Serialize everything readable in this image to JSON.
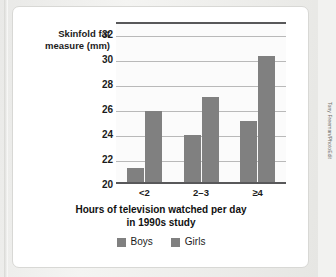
{
  "figure": {
    "credit": "Tony Freeman/PhotoEdit"
  },
  "chart_data": {
    "type": "bar",
    "title": "",
    "xlabel": "Hours of television watched per day in 1990s study",
    "xlabel_line1": "Hours of television watched per day",
    "xlabel_line2": "in 1990s study",
    "ylabel": "Skinfold fat measure (mm)",
    "ylabel_line1": "Skinfold fat",
    "ylabel_line2": "measure (mm)",
    "categories": [
      "<2",
      "2–3",
      "≥4"
    ],
    "series": [
      {
        "name": "Boys",
        "color": "#808080",
        "values": [
          21.1,
          23.8,
          24.9
        ]
      },
      {
        "name": "Girls",
        "color": "#808080",
        "values": [
          25.7,
          26.8,
          30.1
        ]
      }
    ],
    "ylim": [
      20,
      33
    ],
    "yticks": [
      20,
      22,
      24,
      26,
      28,
      30,
      32
    ],
    "ytick_labels": [
      "20",
      "22",
      "24",
      "26",
      "28",
      "30",
      "32"
    ],
    "grid": true,
    "grid_axis": "y",
    "legend": {
      "position": "bottom",
      "entries": [
        {
          "label": "Boys",
          "color": "#808080"
        },
        {
          "label": "Girls",
          "color": "#808080"
        }
      ]
    },
    "plot_background": "#fbfbfb",
    "axis_color": "#58585a"
  }
}
